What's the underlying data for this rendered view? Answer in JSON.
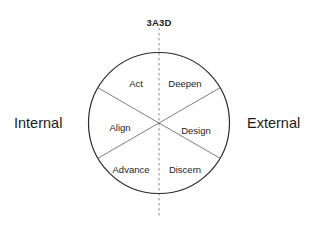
{
  "diagram": {
    "axis_title": "3A3D",
    "poles": {
      "left_label": "Internal",
      "right_label": "External"
    },
    "circle": {
      "center_x": 159,
      "center_y": 123,
      "radius": 70.5,
      "stroke_color": "#2b2b2b"
    },
    "divider_dashed": {
      "color": "#8a8a8a",
      "top_y": 28,
      "bottom_y": 216
    },
    "divider_diagonals": {
      "color": "#6f6f6f"
    },
    "sectors": [
      {
        "key": "act",
        "label": "Act",
        "x": 136,
        "y": 84,
        "side": "internal"
      },
      {
        "key": "deepen",
        "label": "Deepen",
        "x": 185,
        "y": 84,
        "side": "external"
      },
      {
        "key": "align",
        "label": "Align",
        "x": 120,
        "y": 128,
        "side": "internal"
      },
      {
        "key": "design",
        "label": "Design",
        "x": 196,
        "y": 131,
        "side": "external"
      },
      {
        "key": "advance",
        "label": "Advance",
        "x": 131,
        "y": 170,
        "side": "internal"
      },
      {
        "key": "discern",
        "label": "Discern",
        "x": 185,
        "y": 170,
        "side": "external"
      }
    ]
  }
}
